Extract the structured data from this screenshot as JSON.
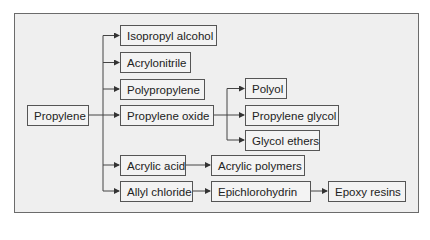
{
  "diagram": {
    "type": "flowchart",
    "title": "",
    "root": "Propylene",
    "colors": {
      "background": "#ffffff",
      "frame_fill": "#efefef",
      "frame_border": "#6b6b6b",
      "node_border": "#555555",
      "edge": "#444444",
      "text": "#222222"
    },
    "nodes": {
      "propylene": "Propylene",
      "isopropyl_alcohol": "Isopropyl alcohol",
      "acrylonitrile": "Acrylonitrile",
      "polypropylene": "Polypropylene",
      "propylene_oxide": "Propylene oxide",
      "polyol": "Polyol",
      "propylene_glycol": "Propylene glycol",
      "glycol_ethers": "Glycol ethers",
      "acrylic_acid": "Acrylic acid",
      "acrylic_polymers": "Acrylic polymers",
      "allyl_chloride": "Allyl chloride",
      "epichlorohydrin": "Epichlorohydrin",
      "epoxy_resins": "Epoxy resins"
    },
    "edges": [
      [
        "Propylene",
        "Isopropyl alcohol"
      ],
      [
        "Propylene",
        "Acrylonitrile"
      ],
      [
        "Propylene",
        "Polypropylene"
      ],
      [
        "Propylene",
        "Propylene oxide"
      ],
      [
        "Propylene",
        "Acrylic acid"
      ],
      [
        "Propylene",
        "Allyl chloride"
      ],
      [
        "Propylene oxide",
        "Polyol"
      ],
      [
        "Propylene oxide",
        "Propylene glycol"
      ],
      [
        "Propylene oxide",
        "Glycol ethers"
      ],
      [
        "Acrylic acid",
        "Acrylic polymers"
      ],
      [
        "Allyl chloride",
        "Epichlorohydrin"
      ],
      [
        "Epichlorohydrin",
        "Epoxy resins"
      ]
    ]
  }
}
